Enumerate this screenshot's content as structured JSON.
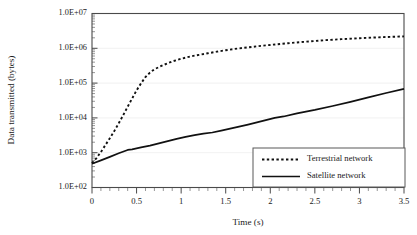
{
  "chart_data": {
    "type": "line",
    "title": "",
    "xlabel": "Time (s)",
    "ylabel": "Data transmitted (bytes)",
    "xlim": [
      0,
      3.5
    ],
    "ylim": [
      100,
      10000000
    ],
    "yscale": "log",
    "xscale": "linear",
    "grid": true,
    "grid_axis": "y",
    "legend_position": "lower-right",
    "xticks": [
      0,
      0.5,
      1,
      1.5,
      2,
      2.5,
      3,
      3.5
    ],
    "xticklabels": [
      "0",
      "0.5",
      "1",
      "1.5",
      "2",
      "2.5",
      "3",
      "3.5"
    ],
    "xminor_tick_step": 0.1,
    "yticks": [
      100,
      1000,
      10000,
      100000,
      1000000,
      10000000
    ],
    "yticklabels": [
      "1.0E+02",
      "1.0E+03",
      "1.0E+04",
      "1.0E+05",
      "1.0E+06",
      "1.0E+07"
    ],
    "series": [
      {
        "name": "Terrestrial network",
        "style": "dotted",
        "color": "#111111",
        "x": [
          0.0,
          0.05,
          0.1,
          0.15,
          0.2,
          0.25,
          0.3,
          0.35,
          0.4,
          0.45,
          0.5,
          0.55,
          0.6,
          0.65,
          0.7,
          0.8,
          0.9,
          1.0,
          1.1,
          1.2,
          1.3,
          1.4,
          1.5,
          1.6,
          1.7,
          1.8,
          1.9,
          2.0,
          2.2,
          2.4,
          2.6,
          2.8,
          3.0,
          3.2,
          3.5
        ],
        "y": [
          500,
          700,
          1050,
          1650,
          2600,
          4200,
          7000,
          12000,
          21000,
          36000,
          62000,
          98000,
          150000,
          200000,
          250000,
          330000,
          420000,
          500000,
          580000,
          650000,
          720000,
          800000,
          880000,
          960000,
          1030000,
          1100000,
          1180000,
          1250000,
          1400000,
          1550000,
          1700000,
          1830000,
          1950000,
          2060000,
          2200000
        ]
      },
      {
        "name": "Satellite network",
        "style": "solid",
        "color": "#111111",
        "x": [
          0.0,
          0.1,
          0.2,
          0.3,
          0.4,
          0.45,
          0.55,
          0.65,
          0.75,
          0.85,
          0.95,
          1.05,
          1.15,
          1.25,
          1.35,
          1.45,
          1.55,
          1.65,
          1.75,
          1.85,
          1.95,
          2.05,
          2.15,
          2.3,
          2.5,
          2.7,
          2.9,
          3.1,
          3.3,
          3.5
        ],
        "y": [
          480,
          600,
          760,
          960,
          1200,
          1250,
          1420,
          1600,
          1850,
          2150,
          2500,
          2850,
          3200,
          3550,
          3800,
          4300,
          4900,
          5600,
          6400,
          7400,
          8600,
          10000,
          11000,
          13500,
          17000,
          22000,
          29000,
          39000,
          52000,
          68000
        ]
      }
    ]
  },
  "axes": {
    "ylabel_text": "Data transmitted (bytes)",
    "xlabel_text": "Time (s)"
  },
  "legend": {
    "entries": [
      {
        "label": "Terrestrial network",
        "style": "dotted"
      },
      {
        "label": "Satellite network",
        "style": "solid"
      }
    ]
  },
  "colors": {
    "series": "#111111",
    "axis": "#4a4a4a",
    "grid": "#ededed",
    "legend_border": "#585858",
    "background": "#ffffff"
  }
}
